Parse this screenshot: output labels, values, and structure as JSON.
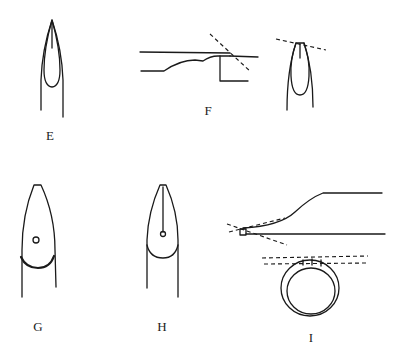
{
  "diagram": {
    "background": "#ffffff",
    "ink_color": "#1a1a1a",
    "figures": [
      {
        "id": "E",
        "label": "E",
        "subject": "pointed (stiletto) nail, front view"
      },
      {
        "id": "F",
        "label": "F",
        "subject": "nail side profile with dashed cutting angle, plus front view with dashed tip line"
      },
      {
        "id": "G",
        "label": "G",
        "subject": "tapered nail with dot at center, bold free-edge arc"
      },
      {
        "id": "H",
        "label": "H",
        "subject": "tapered nail with center line ending in a small circle"
      },
      {
        "id": "I",
        "label": "I",
        "subject": "side profile with dashed angle lines and cross-section ring with dashed guide lines"
      }
    ]
  }
}
